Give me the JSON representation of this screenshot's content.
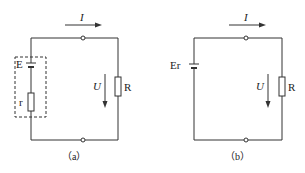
{
  "diagrams": [
    {
      "id": "a",
      "caption": "（a）",
      "labels": {
        "current": "I",
        "voltage": "U",
        "resistor": "R",
        "emf": "E",
        "internal_resistance": "r"
      },
      "description": "Circuit with source E and internal resistance r enclosed in dashed box, connected to external load R"
    },
    {
      "id": "b",
      "caption": "（b）",
      "labels": {
        "current": "I",
        "voltage": "U",
        "resistor": "R",
        "source": "Er"
      },
      "description": "Simplified circuit with combined source Er connected to external load R"
    }
  ],
  "colors": {
    "line": "#333333",
    "background": "#ffffff"
  }
}
